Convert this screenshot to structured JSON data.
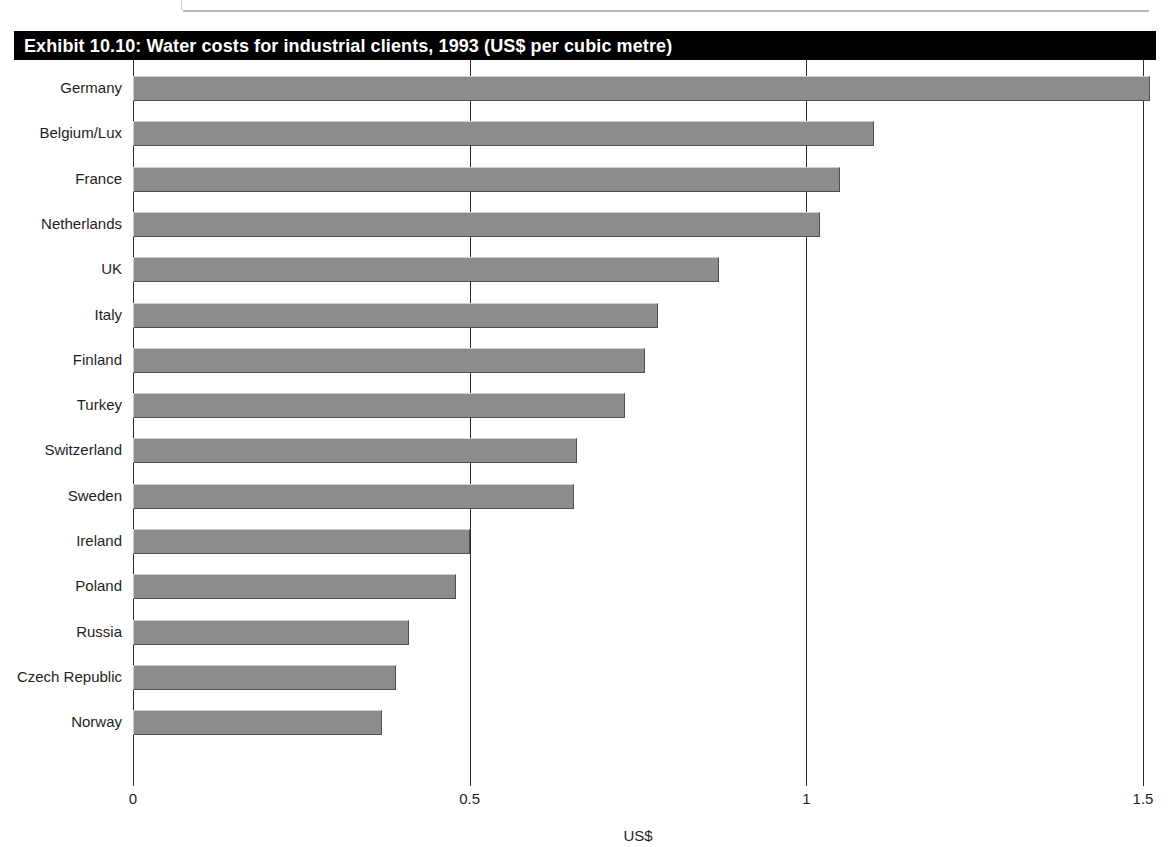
{
  "page": {
    "artifact_text": "",
    "background_color": "#ffffff"
  },
  "exhibit": {
    "title": "Exhibit 10.10: Water costs for industrial clients, 1993 (US$ per cubic metre)",
    "title_bar_color": "#000000",
    "title_text_color": "#ffffff"
  },
  "chart_data": {
    "type": "bar",
    "orientation": "horizontal",
    "title": "Exhibit 10.10: Water costs for industrial clients, 1993 (US$ per cubic metre)",
    "xlabel": "US$",
    "ylabel": "",
    "xlim": [
      0,
      1.5
    ],
    "xticks": [
      0,
      0.5,
      1,
      1.5
    ],
    "xtick_labels": [
      "0",
      "0.5",
      "1",
      "1.5"
    ],
    "grid": true,
    "grid_axis": "x",
    "legend": null,
    "bar_color": "#8c8c8c",
    "categories": [
      "Germany",
      "Belgium/Lux",
      "France",
      "Netherlands",
      "UK",
      "Italy",
      "Finland",
      "Turkey",
      "Switzerland",
      "Sweden",
      "Ireland",
      "Poland",
      "Russia",
      "Czech Republic",
      "Norway"
    ],
    "values": [
      1.51,
      1.1,
      1.05,
      1.02,
      0.87,
      0.78,
      0.76,
      0.73,
      0.66,
      0.655,
      0.5,
      0.48,
      0.41,
      0.39,
      0.37
    ],
    "units": "US$ per cubic metre",
    "year": 1993
  }
}
